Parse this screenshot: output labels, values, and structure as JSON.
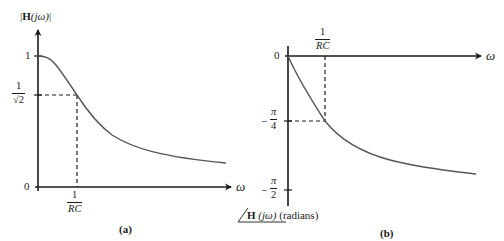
{
  "figure": {
    "panel_a": {
      "caption": "(a)",
      "y_axis_label": {
        "bar_open": "|",
        "H": "H",
        "arg": "(jω)",
        "bar_close": "|"
      },
      "x_axis_label": "ω",
      "y_ticks": {
        "one": "1",
        "inv_sqrt2_num": "1",
        "inv_sqrt2_den": "√2",
        "zero": "0"
      },
      "x_ticks": {
        "cutoff_num": "1",
        "cutoff_den": "RC"
      },
      "curve": "magnitude response |H(jω)| of first-order low-pass filter"
    },
    "panel_b": {
      "caption": "(b)",
      "y_axis_label": {
        "angle_H": "H",
        "arg": "(jω)",
        "unit": "(radians)"
      },
      "x_axis_label": "ω",
      "y_ticks": {
        "zero": "0",
        "neg_pi4_num": "π",
        "neg_pi4_den": "4",
        "neg_pi2_num": "π",
        "neg_pi2_den": "2",
        "minus": "−"
      },
      "x_ticks": {
        "cutoff_num": "1",
        "cutoff_den": "RC"
      },
      "curve": "phase response ∠H(jω) of first-order low-pass filter"
    }
  },
  "colors": {
    "axis": "#1a1a1a",
    "curve": "#555555",
    "dashed": "#1a1a1a"
  }
}
